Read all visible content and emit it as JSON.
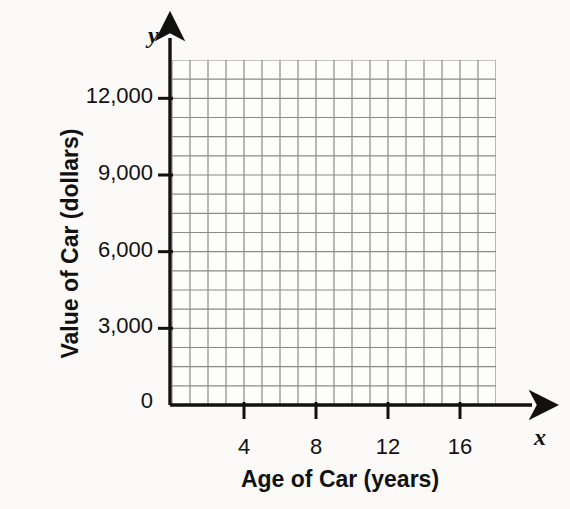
{
  "chart_data": {
    "type": "grid",
    "title": "",
    "xlabel": "Age of Car (years)",
    "ylabel": "Value of Car (dollars)",
    "x_axis_letter": "x",
    "y_axis_letter": "y",
    "origin_label": "0",
    "xlim": [
      0,
      18
    ],
    "ylim": [
      0,
      13500
    ],
    "x_ticks": [
      {
        "value": 4,
        "label": "4"
      },
      {
        "value": 8,
        "label": "8"
      },
      {
        "value": 12,
        "label": "12"
      },
      {
        "value": 16,
        "label": "16"
      }
    ],
    "y_ticks": [
      {
        "value": 3000,
        "label": "3,000"
      },
      {
        "value": 6000,
        "label": "6,000"
      },
      {
        "value": 9000,
        "label": "9,000"
      },
      {
        "value": 12000,
        "label": "12,000"
      }
    ],
    "grid": {
      "visible": true,
      "columns": 18,
      "rows": 18,
      "x_step": 1,
      "y_step": 750,
      "line_color": "#8a8a8a"
    },
    "series": [],
    "values": [],
    "categories": [],
    "annotations": [],
    "legend": {
      "visible": false,
      "position": "none",
      "entries": []
    }
  },
  "colors": {
    "background": "#fbfaf8",
    "plot_background": "#fdfdfb",
    "grid_line": "#8a8a8a",
    "axis_line": "#111111",
    "text": "#111111"
  }
}
